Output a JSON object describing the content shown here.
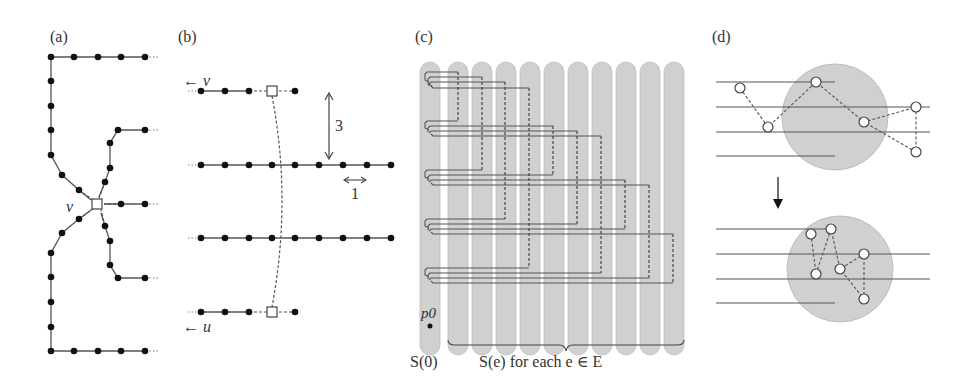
{
  "figure": {
    "panels": [
      {
        "id": "a",
        "label": "(a)",
        "vertex_label": "v"
      },
      {
        "id": "b",
        "label": "(b)",
        "top_arrow_label": "← v",
        "bottom_arrow_label": "← u",
        "vertical_distance_label": "3",
        "horizontal_distance_label": "1"
      },
      {
        "id": "c",
        "label": "(c)",
        "point_label": "p0",
        "left_set_label": "S(0)",
        "brace_label": "S(e) for each e ∈ E"
      },
      {
        "id": "d",
        "label": "(d)"
      }
    ]
  },
  "colors": {
    "line": "#444444",
    "dot": "#111111",
    "region_fill": "#d0d0d0",
    "region_stroke": "#bdbdbd",
    "text": "#333333"
  }
}
